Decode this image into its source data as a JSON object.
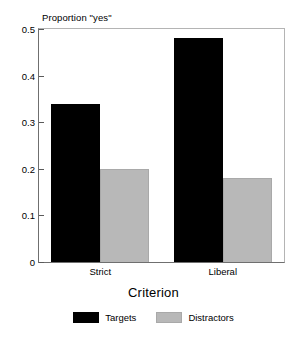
{
  "chart_data": {
    "type": "bar",
    "title": "",
    "xlabel": "Criterion",
    "ylabel": "Proportion \"yes\"",
    "categories": [
      "Strict",
      "Liberal"
    ],
    "series": [
      {
        "name": "Targets",
        "color": "#000000",
        "values": [
          0.34,
          0.48
        ]
      },
      {
        "name": "Distractors",
        "color": "#b8b8b8",
        "values": [
          0.2,
          0.18
        ]
      }
    ],
    "ylim": [
      0,
      0.5
    ],
    "ytick_labels": [
      "0",
      "0.1",
      "0.2",
      "0.3",
      "0.4",
      "0.5"
    ],
    "ytick_values": [
      0,
      0.1,
      0.2,
      0.3,
      0.4,
      0.5
    ],
    "grid": false,
    "legend_position": "bottom",
    "bar_gap_within_group": 0
  },
  "axes": {
    "y_label_text": "Proportion \"yes\"",
    "x_title_text": "Criterion"
  },
  "legend": {
    "entries": [
      {
        "label": "Targets",
        "swatch": "black-swatch"
      },
      {
        "label": "Distractors",
        "swatch": "gray-swatch"
      }
    ]
  },
  "colors": {
    "targets": "#000000",
    "distractors": "#b8b8b8",
    "background": "#ffffff",
    "frame": "#6f6f6f"
  }
}
